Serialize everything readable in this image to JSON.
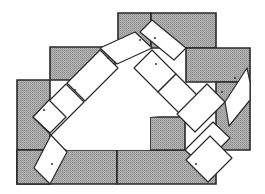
{
  "diagram": {
    "title": "Domino tiling puzzle",
    "colors": {
      "background": "#ffffff",
      "gray_fill": "#a9a9a9",
      "outline": "#2a2a2a",
      "domino_fill": "#ffffff"
    },
    "gray_blocks": [
      {
        "id": "top-left-block",
        "points": "118,13 151,13 151,48 118,48"
      },
      {
        "id": "top-right-block",
        "points": "151,13 216,13 216,48 151,48"
      },
      {
        "id": "right-upper-block",
        "points": "186,48 250,48 250,82 216,82 186,82"
      },
      {
        "id": "right-lower-block",
        "points": "216,82 250,82 250,150 216,150"
      },
      {
        "id": "mid-left-block",
        "points": "50,47 115,47 115,80 50,80"
      },
      {
        "id": "far-left-block",
        "points": "17,80 50,80 50,150 17,150"
      },
      {
        "id": "bottom-left-block",
        "points": "17,150 117,150 117,184 17,184"
      },
      {
        "id": "bottom-right-block",
        "points": "117,150 216,150 216,184 117,184"
      },
      {
        "id": "center-right-block",
        "points": "150,117 185,117 185,150 150,150"
      },
      {
        "id": "far-left-lower-block",
        "points": "17,150 50,150 50,184 17,184"
      }
    ],
    "dominoes": [
      {
        "id": "d1",
        "points": "100,48 135,32 152,48 117,64",
        "dot": [
          140,
          40
        ]
      },
      {
        "id": "d2",
        "points": "140,32 152,20 186,48 174,60",
        "dot": [
          155,
          38
        ]
      },
      {
        "id": "d3",
        "points": "100,50 118,68 85,101 67,83",
        "dot": [
          108,
          58
        ]
      },
      {
        "id": "d4",
        "points": "66,84 84,102 51,135 33,117",
        "dot": [
          75,
          90
        ]
      },
      {
        "id": "d5",
        "points": "152,50 176,74 158,92 134,68",
        "dot": [
          156,
          64
        ]
      },
      {
        "id": "d6",
        "points": "176,74 207,105 189,123 158,92",
        "dot": [
          196,
          100
        ]
      },
      {
        "id": "d7",
        "points": "207,84 225,102 195,132 177,114",
        "dot": [
          222,
          92
        ]
      },
      {
        "id": "d8",
        "points": "225,102 247,68 250,82 250,100 229,126",
        "dot": [
          235,
          78
        ]
      },
      {
        "id": "d9",
        "points": "33,117 49,100 66,117 50,133",
        "dot": [
          44,
          110
        ]
      },
      {
        "id": "d10",
        "points": "51,135 67,152 50,184 34,168",
        "dot": [
          52,
          164
        ]
      },
      {
        "id": "d11",
        "points": "185,150 213,122 230,138 202,166",
        "dot": [
          198,
          152
        ]
      },
      {
        "id": "d12",
        "points": "186,160 210,136 232,158 208,182",
        "dot": [
          196,
          164
        ]
      }
    ],
    "inner_white_region": "85,101 117,64 134,68 158,92 177,114 150,117 150,150 67,150 51,135"
  }
}
